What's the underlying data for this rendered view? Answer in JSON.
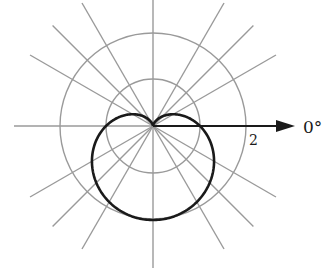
{
  "chart_data": {
    "type": "line",
    "subtype": "polar",
    "title": "",
    "equation": "r = 1 - sin(theta)",
    "curve_name": "cardioid",
    "center_px": [
      153,
      126
    ],
    "unit_px": 47,
    "radial_grid": [
      1,
      2
    ],
    "radial_tick_labels": [
      {
        "value": 2,
        "text": "2"
      }
    ],
    "angular_grid_deg": [
      0,
      30,
      45,
      60,
      90,
      120,
      135,
      150,
      180,
      210,
      225,
      240,
      270,
      300,
      315,
      330
    ],
    "polar_axis_label": "0°",
    "polar_axis_angle_deg": 0,
    "sample_points": [
      {
        "theta_deg": 0,
        "r": 1
      },
      {
        "theta_deg": 30,
        "r": 0.5
      },
      {
        "theta_deg": 90,
        "r": 0
      },
      {
        "theta_deg": 150,
        "r": 0.5
      },
      {
        "theta_deg": 180,
        "r": 1
      },
      {
        "theta_deg": 210,
        "r": 1.5
      },
      {
        "theta_deg": 270,
        "r": 2
      },
      {
        "theta_deg": 330,
        "r": 1.5
      }
    ],
    "rlim": [
      0,
      2
    ],
    "grid": true,
    "legend": null
  },
  "labels": {
    "axis_label": "0°",
    "radius_label": "2"
  },
  "colors": {
    "curve": "#1a1a1a",
    "grid": "#9a9a9a",
    "axis": "#1a1a1a"
  }
}
